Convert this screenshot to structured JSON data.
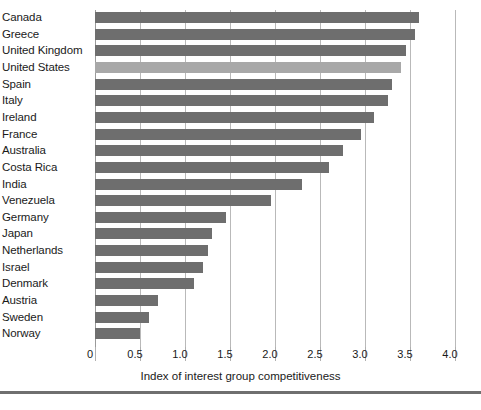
{
  "chart": {
    "type": "bar",
    "orientation": "horizontal",
    "xlabel": "Index of interest group competitiveness",
    "ylabel": "",
    "title": "",
    "xlim": [
      0,
      4.0
    ],
    "xticks": [
      "0",
      "0.5",
      "1.0",
      "1.5",
      "2.0",
      "2.5",
      "3.0",
      "3.5",
      "4.0"
    ],
    "xtick_values": [
      0,
      0.5,
      1.0,
      1.5,
      2.0,
      2.5,
      3.0,
      3.5,
      4.0
    ],
    "grid": true,
    "legend": "none",
    "bar_color": "#6e6e6e",
    "highlight_color": "#a8a8a8",
    "highlight_category": "United States"
  },
  "chart_data": {
    "type": "bar",
    "title": "",
    "xlabel": "Index of interest group competitiveness",
    "ylabel": "",
    "xlim": [
      0,
      4.0
    ],
    "grid": true,
    "legend": "none",
    "categories": [
      "Canada",
      "Greece",
      "United Kingdom",
      "United States",
      "Spain",
      "Italy",
      "Ireland",
      "France",
      "Australia",
      "Costa Rica",
      "India",
      "Venezuela",
      "Germany",
      "Japan",
      "Netherlands",
      "Israel",
      "Denmark",
      "Austria",
      "Sweden",
      "Norway"
    ],
    "values": [
      3.6,
      3.55,
      3.45,
      3.4,
      3.3,
      3.25,
      3.1,
      2.95,
      2.75,
      2.6,
      2.3,
      1.95,
      1.45,
      1.3,
      1.25,
      1.2,
      1.1,
      0.7,
      0.6,
      0.5
    ],
    "highlighted": [
      "United States"
    ]
  }
}
